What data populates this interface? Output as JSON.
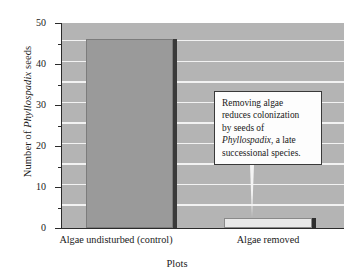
{
  "chart_data": {
    "type": "bar",
    "title": "",
    "categories": [
      "Algae undisturbed (control)",
      "Algae removed"
    ],
    "values": [
      46,
      2.5
    ],
    "series": [
      {
        "name": "Number of Phyllospadix seeds",
        "values": [
          46,
          2.5
        ]
      }
    ],
    "xlabel": "Plots",
    "ylabel_prefix": "Number of ",
    "ylabel_italic": "Phyllospadix",
    "ylabel_suffix": " seeds",
    "ylim": [
      0,
      50
    ],
    "ytick_major": [
      0,
      10,
      20,
      30,
      40,
      50
    ],
    "ytick_minor": [
      5,
      15,
      25,
      35,
      45
    ],
    "ytick_labels": [
      "0",
      "10",
      "20",
      "30",
      "40",
      "50"
    ],
    "grid": "horizontal gridlines every 5 units, white on gray panel",
    "legend": "none",
    "annotations": [
      {
        "text_line_1": "Removing algae",
        "text_line_2": "reduces colonization",
        "text_line_3": "by seeds of",
        "text_line_4_italic": "Phyllospadix",
        "text_line_4_rest": ", a late",
        "text_line_5": "successional species.",
        "points_to": "Algae removed"
      }
    ],
    "colors": {
      "panel": "#b4b4b4",
      "gridline": "#f2f2f2",
      "bar_control": "#9a9a9a",
      "bar_removed": "#e9e9e9",
      "bar_shadow": "#3a3a3a",
      "axis": "#2b2b2b",
      "callout_bg": "#fdfdfd",
      "callout_border": "#3a3a3a",
      "text": "#1a1a1a"
    }
  }
}
